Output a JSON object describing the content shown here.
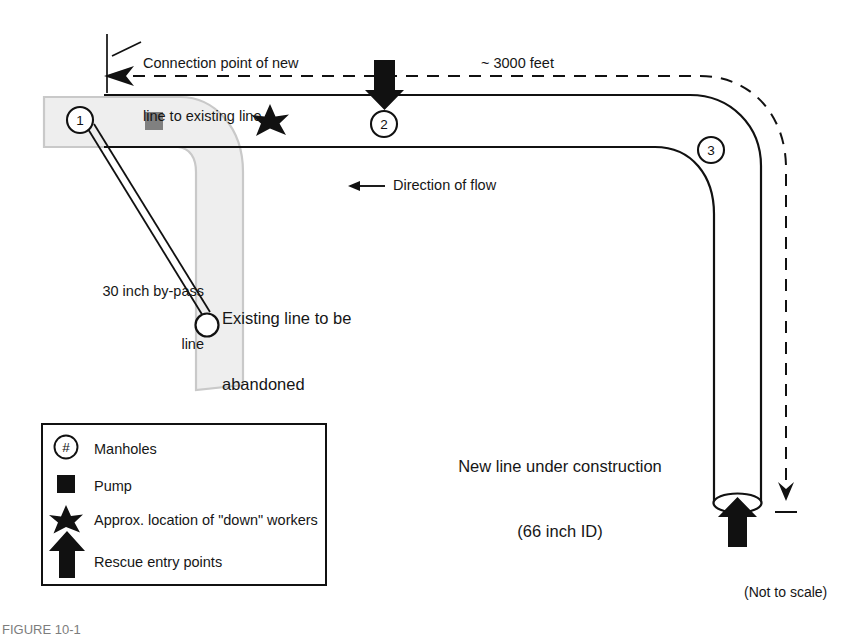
{
  "figure": {
    "caption": "FIGURE 10-1",
    "not_to_scale": "(Not to scale)"
  },
  "annotations": {
    "connection_point_line1": "Connection point of new",
    "connection_point_line2": "line to existing line",
    "distance": "~ 3000 feet",
    "direction_of_flow": "Direction of flow",
    "bypass_line_1": "30 inch by-pass",
    "bypass_line_2": "line",
    "existing_line_1": "Existing line to be",
    "existing_line_2": "abandoned",
    "new_line_1": "New line under construction",
    "new_line_2": "(66 inch ID)"
  },
  "manholes": [
    {
      "id": "1",
      "label": "1"
    },
    {
      "id": "2",
      "label": "2"
    },
    {
      "id": "3",
      "label": "3"
    }
  ],
  "legend": {
    "items": [
      {
        "symbol": "manhole-symbol",
        "glyph": "#",
        "label": "Manholes"
      },
      {
        "symbol": "pump-symbol",
        "label": "Pump"
      },
      {
        "symbol": "star-symbol",
        "label": "Approx. location of \"down\" workers"
      },
      {
        "symbol": "rescue-arrow-symbol",
        "label": "Rescue entry points"
      }
    ]
  },
  "colors": {
    "line": "#111111",
    "band_fill": "#eeeeee",
    "band_stroke": "#c9c9c9",
    "pump_fill": "#808080",
    "symbol_fill": "#111111",
    "background": "#ffffff"
  }
}
